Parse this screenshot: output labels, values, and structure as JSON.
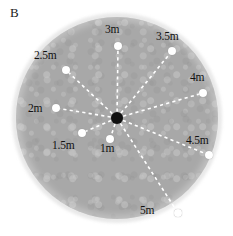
{
  "figure": {
    "panel_letter": "B",
    "background_color": "#ffffff",
    "disc_color": "#a8a8a8",
    "halo_color": "#e9e9e9",
    "center_dot_color": "#101010",
    "node_color": "#ffffff",
    "ray_color": "#ffffff",
    "center": {
      "x": 117,
      "y": 118
    },
    "radius": 101
  },
  "chart_data": {
    "type": "scatter",
    "title": "B",
    "xlabel": "",
    "ylabel": "",
    "center_label": "",
    "units": "m",
    "series": [
      {
        "name": "radial-distance-nodes",
        "points": [
          {
            "label": "1m",
            "distance_m": 1.0,
            "node": {
              "x": 110,
              "y": 139
            },
            "text": {
              "x": 100,
              "y": 143
            }
          },
          {
            "label": "1.5m",
            "distance_m": 1.5,
            "node": {
              "x": 82,
              "y": 133
            },
            "text": {
              "x": 52,
              "y": 140
            }
          },
          {
            "label": "2m",
            "distance_m": 2.0,
            "node": {
              "x": 56,
              "y": 108
            },
            "text": {
              "x": 28,
              "y": 103
            }
          },
          {
            "label": "2.5m",
            "distance_m": 2.5,
            "node": {
              "x": 66,
              "y": 70
            },
            "text": {
              "x": 34,
              "y": 50
            }
          },
          {
            "label": "3m",
            "distance_m": 3.0,
            "node": {
              "x": 118,
              "y": 46
            },
            "text": {
              "x": 105,
              "y": 24
            }
          },
          {
            "label": "3.5m",
            "distance_m": 3.5,
            "node": {
              "x": 172,
              "y": 51
            },
            "text": {
              "x": 156,
              "y": 31
            }
          },
          {
            "label": "4m",
            "distance_m": 4.0,
            "node": {
              "x": 203,
              "y": 93
            },
            "text": {
              "x": 190,
              "y": 72
            }
          },
          {
            "label": "4.5m",
            "distance_m": 4.5,
            "node": {
              "x": 209,
              "y": 155
            },
            "text": {
              "x": 186,
              "y": 135
            }
          },
          {
            "label": "5m",
            "distance_m": 5.0,
            "node": {
              "x": 178,
              "y": 213
            },
            "text": {
              "x": 140,
              "y": 205
            }
          }
        ]
      }
    ],
    "grid": false,
    "legend": null
  }
}
